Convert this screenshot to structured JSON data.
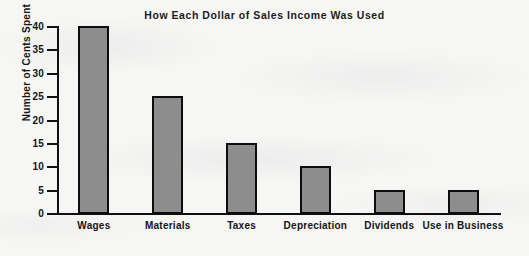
{
  "chart_data": {
    "type": "bar",
    "title": "How Each Dollar of Sales Income Was Used",
    "xlabel": "",
    "ylabel": "Number of Cents Spent",
    "categories": [
      "Wages",
      "Materials",
      "Taxes",
      "Depreciation",
      "Dividends",
      "Use in Business"
    ],
    "values": [
      40,
      25,
      15,
      10,
      5,
      5
    ],
    "ylim": [
      0,
      40
    ],
    "yticks": [
      0,
      5,
      10,
      15,
      20,
      25,
      30,
      35,
      40
    ],
    "ytick_labels": [
      "0",
      "5",
      "10",
      "15",
      "20",
      "25",
      "30",
      "35",
      "40"
    ],
    "grid": false,
    "legend": null,
    "bar_fill_color": "#8d8d8d",
    "bar_edge_color": "#0d0d0d",
    "background_color": "#f6f6f5",
    "text_color": "#141414"
  }
}
